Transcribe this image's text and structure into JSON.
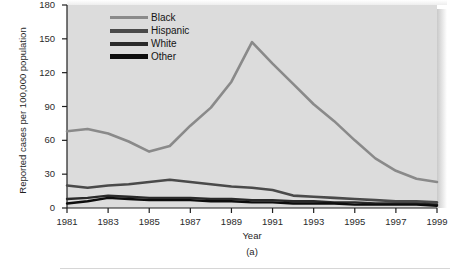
{
  "figure": {
    "caption": "(a)",
    "panel_bg": "#dcdcdc"
  },
  "axes": {
    "xlabel": "Year",
    "ylabel": "Reported cases per 100,000 population",
    "yticks": [
      "180",
      "150",
      "120",
      "90",
      "60",
      "30",
      "0"
    ],
    "xticks": [
      "1981",
      "1983",
      "1985",
      "1987",
      "1989",
      "1991",
      "1993",
      "1995",
      "1997",
      "1999"
    ]
  },
  "legend": {
    "items": [
      {
        "label": "Black",
        "color": "#8a8a8a",
        "thickness": 3
      },
      {
        "label": "Hispanic",
        "color": "#4a4a4a",
        "thickness": 4
      },
      {
        "label": "White",
        "color": "#2a2a2a",
        "thickness": 4
      },
      {
        "label": "Other",
        "color": "#0d0d0d",
        "thickness": 5
      }
    ]
  },
  "chart_data": {
    "type": "line",
    "title": "",
    "subtitle": "",
    "xlabel": "Year",
    "ylabel": "Reported cases per 100,000 population",
    "xlim": [
      1981,
      1999
    ],
    "ylim": [
      0,
      180
    ],
    "yticks": [
      0,
      30,
      60,
      90,
      120,
      150,
      180
    ],
    "xticks": [
      1981,
      1983,
      1985,
      1987,
      1989,
      1991,
      1993,
      1995,
      1997,
      1999
    ],
    "grid": false,
    "legend_position": "top-center",
    "x": [
      1981,
      1982,
      1983,
      1984,
      1985,
      1986,
      1987,
      1988,
      1989,
      1990,
      1991,
      1992,
      1993,
      1994,
      1995,
      1996,
      1997,
      1998,
      1999
    ],
    "series": [
      {
        "name": "Black",
        "color": "#8a8a8a",
        "values": [
          68,
          70,
          66,
          59,
          50,
          55,
          73,
          89,
          112,
          147,
          128,
          110,
          92,
          77,
          60,
          44,
          33,
          26,
          23
        ]
      },
      {
        "name": "Hispanic",
        "color": "#4a4a4a",
        "values": [
          20,
          18,
          20,
          21,
          23,
          25,
          23,
          21,
          19,
          18,
          16,
          11,
          10,
          9,
          8,
          7,
          6,
          6,
          5
        ]
      },
      {
        "name": "White",
        "color": "#2a2a2a",
        "values": [
          8,
          9,
          11,
          10,
          9,
          9,
          9,
          8,
          8,
          7,
          7,
          6,
          6,
          5,
          5,
          4,
          4,
          4,
          3
        ]
      },
      {
        "name": "Other",
        "color": "#0d0d0d",
        "values": [
          4,
          6,
          9,
          8,
          7,
          7,
          7,
          6,
          6,
          5,
          5,
          4,
          4,
          4,
          3,
          3,
          3,
          3,
          2
        ]
      }
    ]
  }
}
